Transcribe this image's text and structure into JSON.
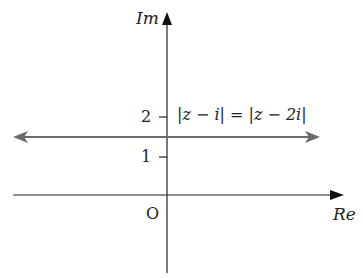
{
  "figure": {
    "type": "argand-diagram",
    "axes": {
      "x_label": "Re",
      "y_label": "Im",
      "origin_label": "O"
    },
    "ticks": {
      "y": [
        {
          "value": 2,
          "label": "2"
        },
        {
          "value": 1,
          "label": "1"
        }
      ]
    },
    "locus": {
      "equation": "|z − i| = |z − 2i|",
      "description": "horizontal line Im(z) = 1.5, double-headed arrow",
      "im_value": 1.5,
      "color": "#6b6b6b"
    },
    "axis_color": "#222222"
  }
}
